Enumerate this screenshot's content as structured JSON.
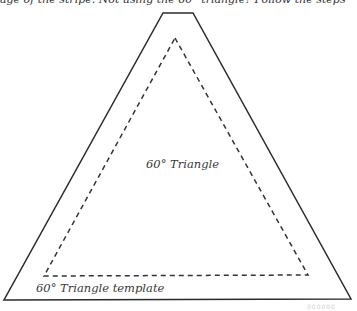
{
  "page": {
    "top_text": "age of the stripe. Not using the 60° triangle? Follow the steps"
  },
  "figure": {
    "center_label": "60° Triangle",
    "template_label": "60° Triangle template",
    "corner_mark": "000000",
    "colors": {
      "outline": "#2b2b2b",
      "dashed": "#333333",
      "text": "#3a3a3a"
    }
  }
}
